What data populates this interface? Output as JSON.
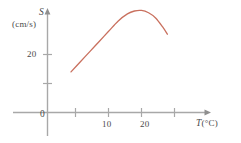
{
  "chart_data": {
    "type": "line",
    "title": "",
    "subtitle": "",
    "xlabel": "T (°C)",
    "ylabel": "S (cm/s)",
    "y_axis_symbol": "S",
    "y_axis_unit": "(cm/s)",
    "x_axis_symbol": "T",
    "x_axis_unit": "(°C)",
    "origin_label": "0",
    "xlim": [
      0,
      27
    ],
    "ylim": [
      0,
      45
    ],
    "x_ticks": [
      5,
      10,
      15,
      20,
      25
    ],
    "x_tick_labels": [
      "",
      "10",
      "",
      "20",
      ""
    ],
    "y_ticks": [
      10,
      20
    ],
    "y_tick_labels": [
      "",
      "20"
    ],
    "grid": false,
    "legend": "none",
    "series": [
      {
        "name": "S vs T",
        "color": "#c9705e",
        "x": [
          5.0,
          7.0,
          9.0,
          11.0,
          13.0,
          15.0,
          17.0,
          18.5,
          20.0,
          21.5,
          23.0,
          24.5,
          25.5
        ],
        "y": [
          14.0,
          17.5,
          21.0,
          24.5,
          28.0,
          31.5,
          34.0,
          35.0,
          35.2,
          34.4,
          32.6,
          29.5,
          27.0
        ]
      }
    ]
  },
  "labels": {
    "y_symbol": "S",
    "y_unit": "(cm/s)",
    "y_tick_20": "20",
    "origin": "0",
    "x_tick_10": "10",
    "x_tick_20": "20",
    "x_symbol": "T",
    "x_unit": "(°C)"
  }
}
